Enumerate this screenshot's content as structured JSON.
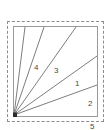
{
  "figure": {
    "type": "geometry-diagram",
    "colors": {
      "background": "#ffffff",
      "square_stroke": "#9a9a9a",
      "ray_stroke": "#6e6e6e",
      "vertex_marker": "#2b2b2b",
      "selection_border": "#8c8c8c",
      "label_text": "#4a4a4a"
    },
    "selection_box": {
      "style": "dashed",
      "x": 7,
      "y": 21,
      "width": 97,
      "height": 101
    },
    "square": {
      "x": 13,
      "y": 26,
      "width": 84,
      "height": 90
    },
    "vertex": {
      "name": "apex",
      "x": 1,
      "y": 89,
      "marker": "filled-square",
      "marker_size": 5
    },
    "rays": [
      {
        "label": "4",
        "order": 1,
        "end_x": 12,
        "end_y": 1,
        "label_x": 21,
        "label_y": 38
      },
      {
        "label": "3",
        "order": 2,
        "end_x": 31,
        "end_y": 1,
        "label_x": 41,
        "label_y": 41
      },
      {
        "label": "1",
        "order": 3,
        "end_x": 63,
        "end_y": 1,
        "label_x": 62,
        "label_y": 54
      },
      {
        "label": "2",
        "order": 4,
        "end_x": 84,
        "end_y": 30,
        "label_x": 75,
        "label_y": 74
      },
      {
        "label": "5",
        "order": 5,
        "end_x": 84,
        "end_y": 59,
        "label_x": 77,
        "label_y": 97
      }
    ],
    "labels": [
      "4",
      "3",
      "1",
      "2",
      "5"
    ]
  }
}
